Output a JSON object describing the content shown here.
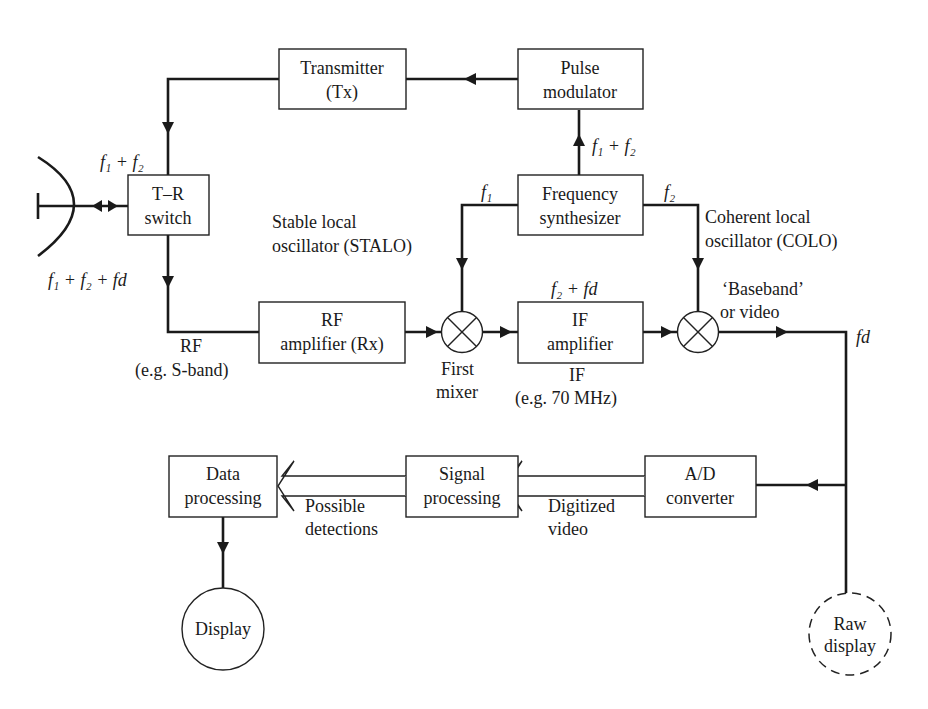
{
  "diagram": {
    "type": "radar block diagram",
    "blocks": {
      "transmitter": {
        "line1": "Transmitter",
        "line2": "(Tx)"
      },
      "pulse_modulator": {
        "line1": "Pulse",
        "line2": "modulator"
      },
      "tr_switch": {
        "line1": "T–R",
        "line2": "switch"
      },
      "freq_synth": {
        "line1": "Frequency",
        "line2": "synthesizer"
      },
      "rf_amp": {
        "line1": "RF",
        "line2": "amplifier (Rx)"
      },
      "if_amp": {
        "line1": "IF",
        "line2": "amplifier"
      },
      "data_proc": {
        "line1": "Data",
        "line2": "processing"
      },
      "signal_proc": {
        "line1": "Signal",
        "line2": "processing"
      },
      "ad_conv": {
        "line1": "A/D",
        "line2": "converter"
      },
      "display": {
        "label": "Display"
      },
      "raw_display": {
        "line1": "Raw",
        "line2": "display"
      }
    },
    "labels": {
      "tx_out": "f₁ + f₂",
      "synth_to_mod": "f₁ + f₂",
      "rx_in": "f₁ + f₂ + fd",
      "f1": "f₁",
      "f2": "f₂",
      "stalo_1": "Stable local",
      "stalo_2": "oscillator (STALO)",
      "colo_1": "Coherent local",
      "colo_2": "oscillator (COLO)",
      "if_freq": "f₂ + fd",
      "baseband_1": "‘Baseband’",
      "baseband_2": "or video",
      "fd": "fd",
      "rf_1": "RF",
      "rf_2": "(e.g. S-band)",
      "mixer_1": "First",
      "mixer_2": "mixer",
      "if_1": "IF",
      "if_2": "(e.g. 70 MHz)",
      "detections_1": "Possible",
      "detections_2": "detections",
      "digitized_1": "Digitized",
      "digitized_2": "video"
    }
  }
}
